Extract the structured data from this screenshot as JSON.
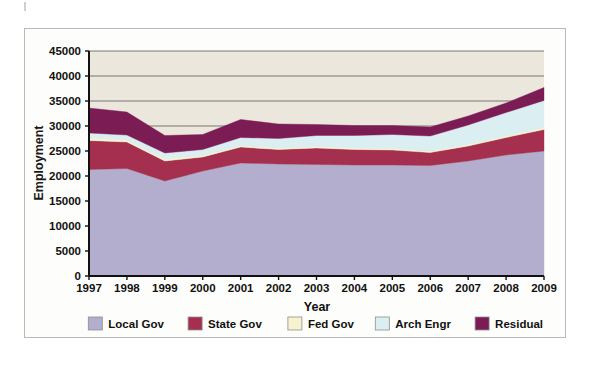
{
  "figure": {
    "y_axis_title": "Employment",
    "x_axis_title": "Year"
  },
  "colors": {
    "local_gov": "#b3adce",
    "state_gov": "#a52f4e",
    "fed_gov": "#f7f2cf",
    "arch_engr": "#dbeef2",
    "residual": "#7c1c55",
    "plot_background": "#ebe7dd",
    "gridline": "#6e6a63",
    "axis": "#111111",
    "frame_border": "#b9b9b9"
  },
  "legend": {
    "position": "bottom",
    "items": [
      {
        "label": "Local Gov",
        "color": "#b3adce"
      },
      {
        "label": "State Gov",
        "color": "#a52f4e"
      },
      {
        "label": "Fed Gov",
        "color": "#f7f2cf"
      },
      {
        "label": "Arch Engr",
        "color": "#dbeef2"
      },
      {
        "label": "Residual",
        "color": "#7c1c55"
      }
    ]
  },
  "chart_data": {
    "type": "area",
    "stacked": true,
    "title": "",
    "subtitle": "",
    "xlabel": "Year",
    "ylabel": "Employment",
    "grid": true,
    "legend_position": "bottom",
    "xlim": [
      1997,
      2009
    ],
    "ylim": [
      0,
      45000
    ],
    "ytick_labels": [
      "0",
      "5000",
      "10000",
      "15000",
      "20000",
      "25000",
      "30000",
      "35000",
      "40000",
      "45000"
    ],
    "yticks": [
      0,
      5000,
      10000,
      15000,
      20000,
      25000,
      30000,
      35000,
      40000,
      45000
    ],
    "categories": [
      1997,
      1998,
      1999,
      2000,
      2001,
      2002,
      2003,
      2004,
      2005,
      2006,
      2007,
      2008,
      2009
    ],
    "xtick_labels": [
      "1997",
      "1998",
      "1999",
      "2000",
      "2001",
      "2002",
      "2003",
      "2004",
      "2005",
      "2006",
      "2007",
      "2008",
      "2009"
    ],
    "series": [
      {
        "name": "Local Gov",
        "color": "#b3adce",
        "values": [
          21300,
          21500,
          19000,
          21000,
          22600,
          22400,
          22300,
          22200,
          22200,
          22100,
          23000,
          24200,
          25000
        ]
      },
      {
        "name": "State Gov",
        "color": "#a52f4e",
        "values": [
          5800,
          5300,
          4000,
          2800,
          3200,
          2900,
          3300,
          3100,
          3000,
          2600,
          3000,
          3500,
          4300
        ]
      },
      {
        "name": "Fed Gov",
        "color": "#f7f2cf",
        "values": [
          500,
          400,
          400,
          300,
          300,
          300,
          300,
          300,
          300,
          300,
          300,
          300,
          400
        ]
      },
      {
        "name": "Arch Engr",
        "color": "#dbeef2",
        "values": [
          1000,
          1000,
          1200,
          1200,
          1600,
          1900,
          2200,
          2500,
          2800,
          3000,
          3900,
          4700,
          5400
        ]
      },
      {
        "name": "Residual",
        "color": "#7c1c55",
        "values": [
          5000,
          4600,
          3500,
          3000,
          3600,
          2900,
          2200,
          2000,
          1800,
          1800,
          1800,
          1900,
          2600
        ]
      }
    ],
    "stack_totals": [
      33600,
      32800,
      28100,
      28300,
      31300,
      30400,
      30300,
      30100,
      30100,
      29800,
      32000,
      34600,
      37700
    ]
  }
}
